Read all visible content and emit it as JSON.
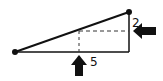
{
  "diagram": {
    "labels": {
      "vertical_offset": "2",
      "horizontal_offset": "5"
    },
    "colors": {
      "stroke": "#111111",
      "background": "#ffffff"
    }
  }
}
